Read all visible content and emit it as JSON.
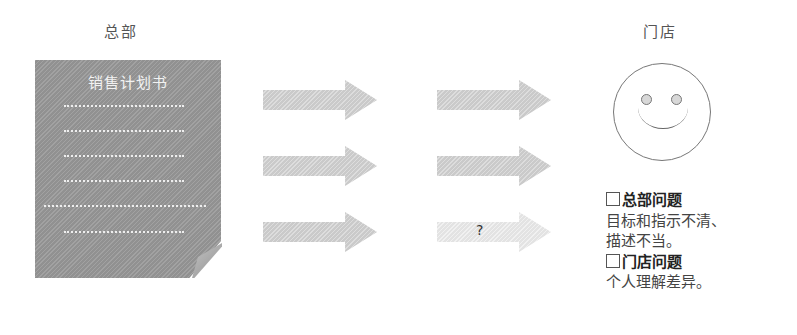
{
  "headquarters": {
    "label": "总部",
    "document": {
      "title": "销售计划书",
      "line_count": 6
    }
  },
  "arrows": {
    "column1": [
      {
        "label": ""
      },
      {
        "label": ""
      },
      {
        "label": ""
      }
    ],
    "column2": [
      {
        "label": ""
      },
      {
        "label": ""
      },
      {
        "label": "?"
      }
    ]
  },
  "store": {
    "label": "门店",
    "face_icon": "smiley-face"
  },
  "notes": {
    "hq_problem": {
      "heading": "总部问题",
      "lines": [
        "目标和指示不清、",
        "描述不当。"
      ]
    },
    "store_problem": {
      "heading": "门店问题",
      "lines": [
        "个人理解差异。"
      ]
    }
  }
}
